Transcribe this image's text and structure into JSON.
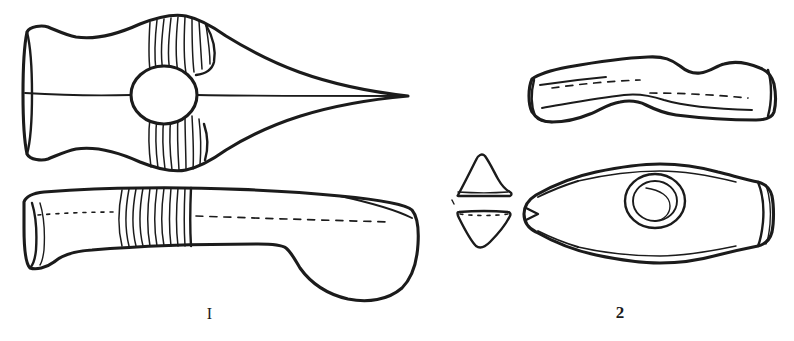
{
  "plate": {
    "background_color": "#ffffff",
    "ink_color": "#1b1b1b",
    "width": 794,
    "height": 341,
    "kind": "archaeological-line-drawing"
  },
  "figures": [
    {
      "caption": "I",
      "position": "left",
      "views": [
        {
          "name": "plan-view",
          "description": "Lozenge shaped axe-hammer seen from above with flared butt, central round shaft-hole and ribbed collar bands above and below the hole, tapering to a sharp point"
        },
        {
          "name": "profile-view",
          "description": "Side elevation of the same axe-hammer with ribbed vertical band and rounded hammer swelling at the lower right"
        }
      ]
    },
    {
      "caption": "2",
      "position": "right",
      "views": [
        {
          "name": "profile-view",
          "description": "Side elevation of a curved axe-hammer with waisted underside and squared butt"
        },
        {
          "name": "cross-sections",
          "description": "Two small transverse sections of the axe body, upper and lower halves"
        },
        {
          "name": "plan-view",
          "description": "Leaf shaped plan of the axe-hammer with concentric ringed shaft-hole and flared butt"
        }
      ]
    }
  ],
  "captions": {
    "left_label": "I",
    "right_label": "2"
  }
}
